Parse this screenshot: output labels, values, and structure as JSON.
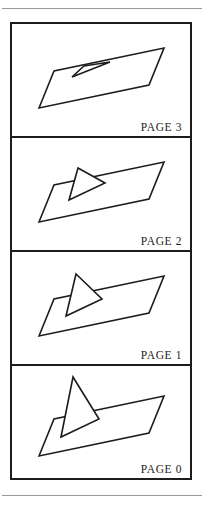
{
  "figure": {
    "background_color": "#ffffff",
    "line_color": "#1c1c1c",
    "rule_color": "#9a9a9a",
    "frame_border_width": 2,
    "top_rule": "horizontal-rule",
    "bottom_rule": "horizontal-rule"
  },
  "panels": [
    {
      "label": "PAGE 3",
      "index": 3,
      "description": "Triangular flap lying nearly flat against the slab",
      "slab_points": "27,84 42,47 152,24 137,61",
      "flap_points": "60,53 72,42 98,38",
      "flap_base_left": "60,53",
      "flap_apex": "72,42",
      "flap_base_right": "98,38",
      "fold_open_degrees": 12
    },
    {
      "label": "PAGE 2",
      "index": 2,
      "description": "Triangular flap partially raised off the slab",
      "slab_points": "27,84 42,47 152,24 137,61",
      "flap_points": "57,62 66,30 93,45",
      "flap_base_left": "57,62",
      "flap_apex": "66,30",
      "flap_base_right": "93,45",
      "fold_open_degrees": 45
    },
    {
      "label": "PAGE 1",
      "index": 1,
      "description": "Triangular flap raised further toward vertical",
      "slab_points": "27,84 42,47 152,24 137,61",
      "flap_points": "54,64 64,22 90,47",
      "flap_base_left": "54,64",
      "flap_apex": "64,22",
      "flap_base_right": "90,47",
      "fold_open_degrees": 68
    },
    {
      "label": "PAGE 0",
      "index": 0,
      "description": "Triangular flap standing fully upright on the slab",
      "slab_points": "27,90 42,53 152,30 137,67",
      "flap_points": "49,71 61,11 87,53",
      "flap_base_left": "49,71",
      "flap_apex": "61,11",
      "flap_base_right": "87,53",
      "fold_open_degrees": 90
    }
  ],
  "chart_data": {
    "type": "line",
    "categories": [
      "PAGE 0",
      "PAGE 1",
      "PAGE 2",
      "PAGE 3"
    ],
    "series": [
      {
        "name": "fold_open_degrees",
        "values": [
          90,
          68,
          45,
          12
        ]
      }
    ],
    "xlabel": "Frame",
    "ylabel": "Fold angle (degrees)",
    "ylim": [
      0,
      90
    ],
    "grid": false,
    "legend": "none"
  }
}
